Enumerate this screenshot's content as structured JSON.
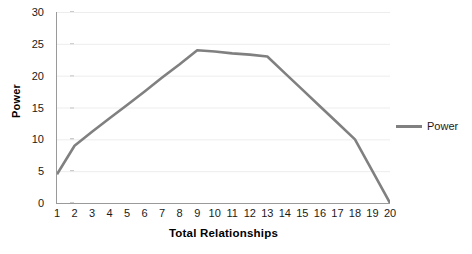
{
  "chart_data": {
    "type": "line",
    "title": "",
    "xlabel": "Total Relationships",
    "ylabel": "Power",
    "xlim": [
      1,
      20
    ],
    "ylim": [
      0,
      30
    ],
    "grid": true,
    "grid_axis": "y",
    "legend_position": "right",
    "x": [
      1,
      2,
      3,
      4,
      5,
      6,
      7,
      8,
      9,
      10,
      11,
      12,
      13,
      14,
      15,
      16,
      17,
      18,
      19,
      20
    ],
    "xticks": [
      "1",
      "2",
      "3",
      "4",
      "5",
      "6",
      "7",
      "8",
      "9",
      "10",
      "11",
      "12",
      "13",
      "14",
      "15",
      "16",
      "17",
      "18",
      "19",
      "20"
    ],
    "yticks": [
      "0",
      "5",
      "10",
      "15",
      "20",
      "25",
      "30"
    ],
    "ytick_values": [
      0,
      5,
      10,
      15,
      20,
      25,
      30
    ],
    "series": [
      {
        "name": "Power",
        "color": "#808080",
        "values": [
          4.5,
          9.0,
          11.2,
          13.3,
          15.4,
          17.5,
          19.7,
          21.8,
          24.0,
          23.8,
          23.5,
          23.3,
          23.0,
          20.4,
          17.8,
          15.2,
          12.6,
          10.0,
          5.0,
          0.0
        ]
      }
    ]
  },
  "legend": {
    "entries": [
      {
        "label": "Power",
        "marker": "line-swatch",
        "color": "#808080"
      }
    ]
  },
  "colors": {
    "series_line": "#808080",
    "axis": "#9a9a9a",
    "gridline": "#ededed",
    "text": "#1a1a1a",
    "background": "#ffffff"
  }
}
